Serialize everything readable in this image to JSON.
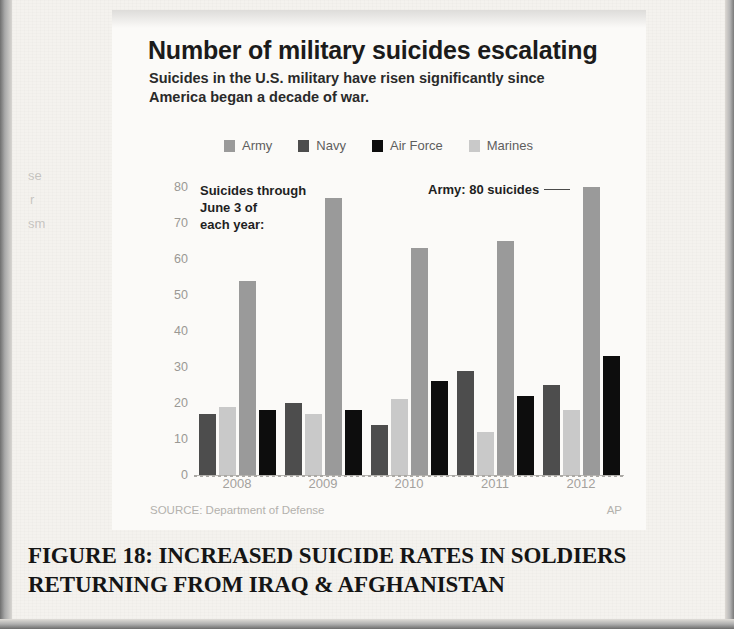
{
  "figure": {
    "caption": "FIGURE 18: INCREASED SUICIDE RATES IN SOLDIERS RETURNING FROM IRAQ & AFGHANISTAN"
  },
  "source": {
    "label": "SOURCE: Department of Defense",
    "credit": "AP"
  },
  "annotations": {
    "left_note": "Suicides through June 3 of each year:",
    "left_note_line1": "Suicides through",
    "left_note_line2": "June 3 of",
    "left_note_line3": "each year:",
    "right_note": "Army: 80 suicides"
  },
  "colors": {
    "army": "#9a9a9a",
    "navy": "#4d4d4d",
    "air_force": "#0d0d0d",
    "marines": "#c9c9c9",
    "axis": "#b9b7b3",
    "tick_text": "#9a9894",
    "title_text": "#1b1b1b"
  },
  "chart_data": {
    "type": "bar",
    "title": "Number of military suicides escalating",
    "subtitle": "Suicides in the U.S. military have risen significantly since America began a decade of war.",
    "xlabel": "",
    "ylabel": "",
    "ylim": [
      0,
      80
    ],
    "yticks": [
      0,
      10,
      20,
      30,
      40,
      50,
      60,
      70,
      80
    ],
    "grid": false,
    "legend_position": "top",
    "categories": [
      "2008",
      "2009",
      "2010",
      "2011",
      "2012"
    ],
    "series": [
      {
        "name": "Navy",
        "color": "#4d4d4d",
        "values": [
          17,
          20,
          14,
          29,
          25
        ]
      },
      {
        "name": "Marines",
        "color": "#c9c9c9",
        "values": [
          19,
          17,
          21,
          12,
          18
        ]
      },
      {
        "name": "Army",
        "color": "#9a9a9a",
        "values": [
          54,
          77,
          63,
          65,
          80
        ]
      },
      {
        "name": "Air Force",
        "color": "#0d0d0d",
        "values": [
          18,
          18,
          26,
          22,
          33
        ]
      }
    ],
    "legend_order": [
      "Army",
      "Navy",
      "Air Force",
      "Marines"
    ],
    "annotations": [
      {
        "text": "Army: 80 suicides",
        "points_to": {
          "category": "2012",
          "series": "Army",
          "value": 80
        }
      },
      {
        "text": "Suicides through June 3 of each year:"
      }
    ]
  }
}
